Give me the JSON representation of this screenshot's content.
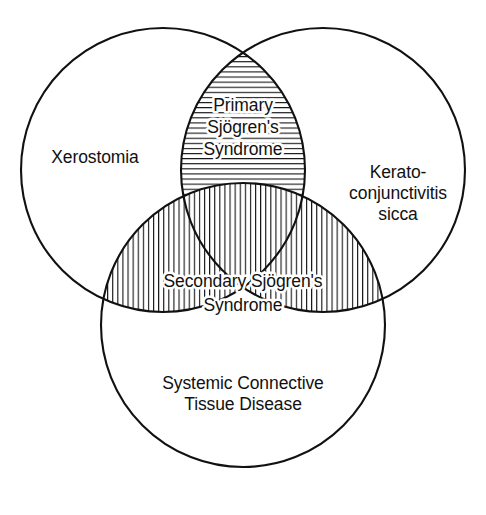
{
  "figure": {
    "type": "venn-diagram",
    "title": "",
    "background_color": "#ffffff",
    "line_color": "#111111",
    "hatch_color": "#111111",
    "set_count": 3
  },
  "sets": [
    {
      "id": "xerostomia",
      "label": "Xerostomia",
      "lines": [
        "Xerostomia"
      ],
      "position": "left",
      "center": {
        "x": 163,
        "y": 170
      },
      "radius": 142
    },
    {
      "id": "keratoconjunctivitis-sicca",
      "label": "Kerato-conjunctivitis sicca",
      "lines": [
        "Kerato-",
        "conjunctivitis",
        "sicca"
      ],
      "position": "right",
      "center": {
        "x": 323,
        "y": 170
      },
      "radius": 142
    },
    {
      "id": "systemic-connective-tissue-disease",
      "label": "Systemic Connective Tissue Disease",
      "lines": [
        "Systemic Connective",
        "Tissue Disease"
      ],
      "position": "bottom",
      "center": {
        "x": 243,
        "y": 325
      },
      "radius": 142
    }
  ],
  "regions": [
    {
      "id": "primary-sjogrens-syndrome",
      "label": "Primary Sjögren's Syndrome",
      "lines": [
        "Primary",
        "Sjögren's",
        "Syndrome"
      ],
      "hatch": "horizontal",
      "members": [
        "xerostomia",
        "keratoconjunctivitis-sicca"
      ],
      "excludes": [
        "systemic-connective-tissue-disease"
      ]
    },
    {
      "id": "secondary-sjogrens-syndrome",
      "label": "Secondary Sjögren's Syndrome",
      "lines": [
        "Secondary Sjögren's",
        "Syndrome"
      ],
      "hatch": "vertical",
      "members": [
        "systemic-connective-tissue-disease",
        "xerostomia",
        "keratoconjunctivitis-sicca"
      ],
      "excludes": []
    }
  ]
}
